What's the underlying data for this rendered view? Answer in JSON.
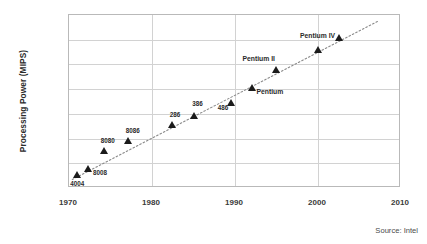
{
  "chart_data": {
    "type": "scatter",
    "title": "",
    "xlabel": "",
    "ylabel": "Processing Power (MIPS)",
    "xlim": [
      1970,
      2010
    ],
    "ylim": [
      0.01,
      100000
    ],
    "yscale": "log",
    "xscale": "linear",
    "grid": true,
    "legend": false,
    "source": "Source: Intel",
    "xticks": [
      "1970",
      "1980",
      "1990",
      "2000",
      "2010"
    ],
    "xtick_values": [
      1970,
      1980,
      1990,
      2000,
      2010
    ],
    "yticks": [
      "0.01",
      "0.1",
      "1",
      "10",
      "100",
      "1000",
      "10000",
      "100000"
    ],
    "ytick_values": [
      0.01,
      0.1,
      1,
      10,
      100,
      1000,
      10000,
      100000
    ],
    "series": [
      {
        "name": "Intel processors",
        "marker": "triangle",
        "color": "#1b1b1b",
        "points": [
          {
            "label": "4004",
            "x": 1971.0,
            "y": 0.035,
            "label_dx": -7,
            "label_dy": 9
          },
          {
            "label": "8008",
            "x": 1972.3,
            "y": 0.06,
            "label_dx": 5,
            "label_dy": 4
          },
          {
            "label": "8080",
            "x": 1974.2,
            "y": 0.32,
            "label_dx": -3,
            "label_dy": -10
          },
          {
            "label": "8086",
            "x": 1977.2,
            "y": 0.8,
            "label_dx": -3,
            "label_dy": -10
          },
          {
            "label": "286",
            "x": 1982.5,
            "y": 3.5,
            "label_dx": -3,
            "label_dy": -10
          },
          {
            "label": "386",
            "x": 1985.1,
            "y": 8.5,
            "label_dx": -2,
            "label_dy": -12
          },
          {
            "label": "486",
            "x": 1989.5,
            "y": 27,
            "label_dx": -13,
            "label_dy": 5
          },
          {
            "label": "Pentium",
            "x": 1992.1,
            "y": 115,
            "label_dx": 4,
            "label_dy": 4
          },
          {
            "label": "Pentium II",
            "x": 1995.0,
            "y": 620,
            "label_dx": -34,
            "label_dy": -11
          },
          {
            "label": "Pentium IV",
            "x": 2000.0,
            "y": 3800,
            "label_dx": -18,
            "label_dy": -14
          },
          {
            "label": "",
            "x": 2002.6,
            "y": 12000,
            "label_dx": 0,
            "label_dy": 0
          }
        ]
      }
    ],
    "trendline": {
      "style": "dotted",
      "color": "#8a8a8a",
      "x_start": 1970.4,
      "y_start": 0.022,
      "x_end": 2007.3,
      "y_end": 58000
    }
  },
  "colors": {
    "background": "#ffffff",
    "grid": "#d2d2d2",
    "frame": "#b9b9b9",
    "marker": "#1b1b1b",
    "text": "#3a3a3a",
    "trend": "#8a8a8a"
  }
}
